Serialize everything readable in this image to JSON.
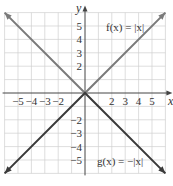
{
  "chart_data": {
    "type": "line",
    "title": "",
    "xlabel": "x",
    "ylabel": "y",
    "xlim": [
      -6,
      6
    ],
    "ylim": [
      -6,
      6
    ],
    "grid": true,
    "x_ticks": [
      -5,
      -4,
      -3,
      -2,
      2,
      3,
      4,
      5
    ],
    "y_ticks": [
      5,
      4,
      3,
      2,
      -2,
      -3,
      -4,
      -5
    ],
    "x_tick_labels": [
      "−5",
      "−4",
      "−3",
      "−2",
      "2",
      "3",
      "4",
      "5"
    ],
    "y_tick_labels": [
      "5",
      "4",
      "3",
      "2",
      "−2",
      "−3",
      "−4",
      "−5"
    ],
    "series": [
      {
        "name": "f(x) = |x|",
        "x": [
          -6,
          0,
          6
        ],
        "values": [
          6,
          0,
          6
        ],
        "color": "#7a7a7a"
      },
      {
        "name": "g(x) = −|x|",
        "x": [
          -6,
          0,
          6
        ],
        "values": [
          -6,
          0,
          -6
        ],
        "color": "#3a3a3a"
      }
    ],
    "annotations": [
      {
        "text": "f(x) = |x|",
        "x": 3.7,
        "y": 4.9
      },
      {
        "text": "g(x) = −|x|",
        "x": 3.7,
        "y": -5.0
      }
    ]
  },
  "labels": {
    "x_axis": "x",
    "y_axis": "y",
    "f_label": "f(x) = |x|",
    "g_label": "g(x) = −|x|"
  }
}
